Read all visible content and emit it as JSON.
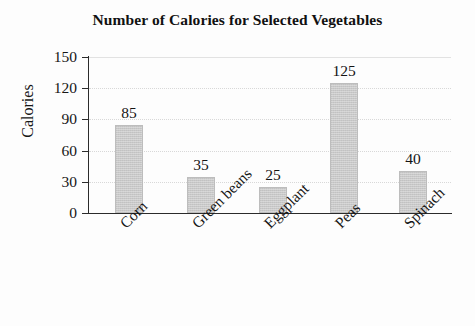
{
  "chart_data": {
    "type": "bar",
    "title": "Number of Calories for Selected Vegetables",
    "xlabel": "",
    "ylabel": "Calories",
    "categories": [
      "Corn",
      "Green beans",
      "Eggplant",
      "Peas",
      "Spinach"
    ],
    "values": [
      85,
      35,
      25,
      125,
      40
    ],
    "value_labels": [
      "85",
      "35",
      "25",
      "125",
      "40"
    ],
    "ylim": [
      0,
      150
    ],
    "yticks": [
      0,
      30,
      60,
      90,
      120,
      150
    ],
    "ytick_labels": [
      "0",
      "30",
      "60",
      "90",
      "120",
      "150"
    ],
    "grid": true,
    "grid_axis": "y",
    "legend": false,
    "legend_position": "none",
    "bar_color": "#c9c9c9",
    "axis_color": "#2b2b2b",
    "gridline_color": "#d8d8d8",
    "background_color": "#fdfdfd",
    "text_color": "#151515",
    "category_label_rotation": -45,
    "series": [
      {
        "name": "Calories",
        "values": [
          85,
          35,
          25,
          125,
          40
        ]
      }
    ],
    "points": [
      {
        "category": "Corn",
        "value": 85
      },
      {
        "category": "Green beans",
        "value": 35
      },
      {
        "category": "Eggplant",
        "value": 25
      },
      {
        "category": "Peas",
        "value": 125
      },
      {
        "category": "Spinach",
        "value": 40
      }
    ]
  }
}
